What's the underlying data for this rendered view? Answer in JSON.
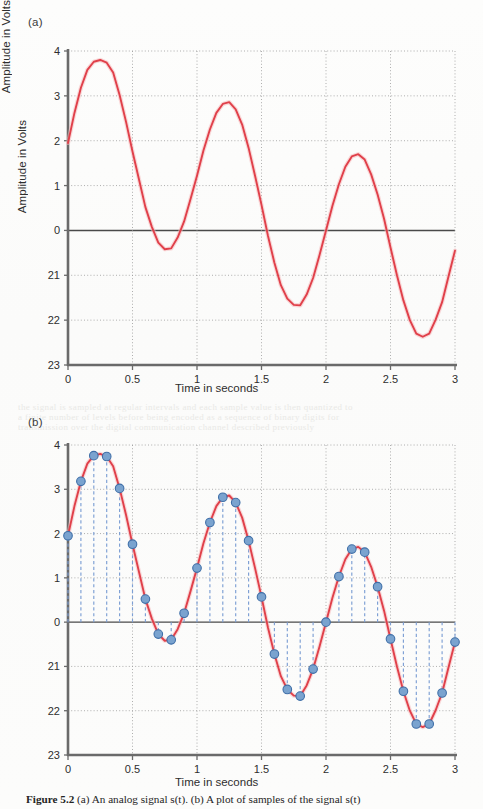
{
  "figure": {
    "caption_bold": "Figure 5.2",
    "caption_rest": "(a) An analog signal s(t). (b) A plot of samples of the signal s(t)"
  },
  "panels": {
    "a": {
      "tag": "(a)",
      "ylabel": "Amplitude in Volts",
      "xlabel": "Time in seconds"
    },
    "b": {
      "tag": "(b)",
      "ylabel": "Amplitude in Volts",
      "xlabel": "Time in seconds"
    }
  },
  "colors": {
    "signal": "#e0404a",
    "signal_glow": "#f6b9bb",
    "sample_dot_fill": "#7aa3cf",
    "sample_dot_stroke": "#3f6fa8",
    "stem": "#7d9fd4",
    "axis": "#6a6a6a",
    "zero_line": "#4a4a4a",
    "grid": "#9a9a9a",
    "text": "#2e2e2e"
  },
  "chart_data": [
    {
      "type": "line",
      "panel": "a",
      "title": "(a) An analog signal s(t)",
      "xlabel": "Time in seconds",
      "ylabel": "Amplitude in Volts",
      "xlim": [
        0,
        3
      ],
      "ylim": [
        -3,
        4
      ],
      "xticks": [
        0,
        0.5,
        1,
        1.5,
        2,
        2.5,
        3
      ],
      "xticklabels": [
        "0",
        "0.5",
        "1",
        "1.5",
        "2",
        "2.5",
        "3"
      ],
      "yticks": [
        4,
        3,
        2,
        1,
        0,
        -1,
        -2,
        -3
      ],
      "yticklabels": [
        "4",
        "3",
        "2",
        "1",
        "0",
        "21",
        "22",
        "23"
      ],
      "grid": true,
      "legend": "none",
      "series": [
        {
          "name": "s(t)",
          "color": "#e0404a",
          "x": [
            0.0,
            0.05,
            0.1,
            0.15,
            0.2,
            0.25,
            0.3,
            0.35,
            0.4,
            0.45,
            0.5,
            0.55,
            0.6,
            0.65,
            0.7,
            0.75,
            0.8,
            0.85,
            0.9,
            0.95,
            1.0,
            1.05,
            1.1,
            1.15,
            1.2,
            1.25,
            1.3,
            1.35,
            1.4,
            1.45,
            1.5,
            1.55,
            1.6,
            1.65,
            1.7,
            1.75,
            1.8,
            1.85,
            1.9,
            1.95,
            2.0,
            2.05,
            2.1,
            2.15,
            2.2,
            2.25,
            2.3,
            2.35,
            2.4,
            2.45,
            2.5,
            2.55,
            2.6,
            2.65,
            2.7,
            2.75,
            2.8,
            2.85,
            2.9,
            2.95,
            3.0
          ],
          "y": [
            1.95,
            2.62,
            3.18,
            3.58,
            3.76,
            3.8,
            3.74,
            3.52,
            3.02,
            2.42,
            1.76,
            1.14,
            0.52,
            0.08,
            -0.27,
            -0.42,
            -0.4,
            -0.16,
            0.2,
            0.7,
            1.22,
            1.78,
            2.25,
            2.62,
            2.82,
            2.86,
            2.7,
            2.36,
            1.84,
            1.22,
            0.57,
            -0.12,
            -0.72,
            -1.22,
            -1.52,
            -1.66,
            -1.67,
            -1.43,
            -1.06,
            -0.55,
            0.0,
            0.55,
            1.03,
            1.42,
            1.65,
            1.7,
            1.58,
            1.25,
            0.8,
            0.26,
            -0.38,
            -1.0,
            -1.56,
            -2.0,
            -2.3,
            -2.37,
            -2.3,
            -1.99,
            -1.6,
            -1.02,
            -0.45
          ]
        }
      ]
    },
    {
      "type": "line",
      "panel": "b",
      "title": "(b) A plot of samples of the signal s(t)",
      "xlabel": "Time in seconds",
      "ylabel": "Amplitude in Volts",
      "xlim": [
        0,
        3
      ],
      "ylim": [
        -3,
        4
      ],
      "xticks": [
        0,
        0.5,
        1,
        1.5,
        2,
        2.5,
        3
      ],
      "xticklabels": [
        "0",
        "0.5",
        "1",
        "1.5",
        "2",
        "2.5",
        "3"
      ],
      "yticks": [
        4,
        3,
        2,
        1,
        0,
        -1,
        -2,
        -3
      ],
      "yticklabels": [
        "4",
        "3",
        "2",
        "1",
        "0",
        "21",
        "22",
        "23"
      ],
      "grid": true,
      "legend": "none",
      "sampling_interval": 0.1,
      "series": [
        {
          "name": "s(t)",
          "color": "#e0404a",
          "x": [
            0.0,
            0.05,
            0.1,
            0.15,
            0.2,
            0.25,
            0.3,
            0.35,
            0.4,
            0.45,
            0.5,
            0.55,
            0.6,
            0.65,
            0.7,
            0.75,
            0.8,
            0.85,
            0.9,
            0.95,
            1.0,
            1.05,
            1.1,
            1.15,
            1.2,
            1.25,
            1.3,
            1.35,
            1.4,
            1.45,
            1.5,
            1.55,
            1.6,
            1.65,
            1.7,
            1.75,
            1.8,
            1.85,
            1.9,
            1.95,
            2.0,
            2.05,
            2.1,
            2.15,
            2.2,
            2.25,
            2.3,
            2.35,
            2.4,
            2.45,
            2.5,
            2.55,
            2.6,
            2.65,
            2.7,
            2.75,
            2.8,
            2.85,
            2.9,
            2.95,
            3.0
          ],
          "y": [
            1.95,
            2.62,
            3.18,
            3.58,
            3.76,
            3.8,
            3.74,
            3.52,
            3.02,
            2.42,
            1.76,
            1.14,
            0.52,
            0.08,
            -0.27,
            -0.42,
            -0.4,
            -0.16,
            0.2,
            0.7,
            1.22,
            1.78,
            2.25,
            2.62,
            2.82,
            2.86,
            2.7,
            2.36,
            1.84,
            1.22,
            0.57,
            -0.12,
            -0.72,
            -1.22,
            -1.52,
            -1.66,
            -1.67,
            -1.43,
            -1.06,
            -0.55,
            0.0,
            0.55,
            1.03,
            1.42,
            1.65,
            1.7,
            1.58,
            1.25,
            0.8,
            0.26,
            -0.38,
            -1.0,
            -1.56,
            -2.0,
            -2.3,
            -2.37,
            -2.3,
            -1.99,
            -1.6,
            -1.02,
            -0.45
          ]
        },
        {
          "name": "samples",
          "color": "#7aa3cf",
          "x": [
            0.0,
            0.1,
            0.2,
            0.3,
            0.4,
            0.5,
            0.6,
            0.7,
            0.8,
            0.9,
            1.0,
            1.1,
            1.2,
            1.3,
            1.4,
            1.5,
            1.6,
            1.7,
            1.8,
            1.9,
            2.0,
            2.1,
            2.2,
            2.3,
            2.4,
            2.5,
            2.6,
            2.7,
            2.8,
            2.9,
            3.0
          ],
          "y": [
            1.95,
            3.18,
            3.76,
            3.74,
            3.02,
            1.76,
            0.52,
            -0.27,
            -0.4,
            0.2,
            1.22,
            2.25,
            2.82,
            2.7,
            1.84,
            0.57,
            -0.72,
            -1.52,
            -1.67,
            -1.06,
            0.0,
            1.03,
            1.65,
            1.58,
            0.8,
            -0.38,
            -1.56,
            -2.3,
            -2.3,
            -1.6,
            -0.45
          ]
        }
      ]
    }
  ],
  "ghost_text": {
    "line1": "the signal is sampled at regular intervals and each sample value is then quantized to",
    "line2": "a finite number of levels before being encoded as a sequence of binary digits for",
    "line3": "transmission over the digital communication channel described previously"
  }
}
